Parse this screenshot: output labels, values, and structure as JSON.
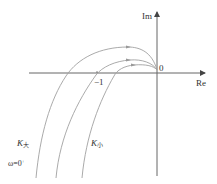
{
  "diagram": {
    "type": "nyquist-plot",
    "axes": {
      "real_label": "Re",
      "imag_label": "Im",
      "origin_label": "0",
      "minus_one_label": "−1"
    },
    "curves": [
      {
        "name": "K大",
        "description": "outer curve (large gain)",
        "crosses_real_axis_left_of": -1
      },
      {
        "name": "middle",
        "description": "curve passing through (−1, j0)",
        "crosses_real_axis_at": -1
      },
      {
        "name": "K小",
        "description": "inner curve (small gain)",
        "crosses_real_axis_right_of": -1
      }
    ],
    "labels": {
      "k_large_base": "K",
      "k_large_sub": "大",
      "k_small_base": "K",
      "k_small_sub": "小",
      "omega_base": "ω=0",
      "omega_sup": "+"
    },
    "colors": {
      "axis": "#555555",
      "curve": "#9a9a9a",
      "text": "#333333"
    }
  }
}
